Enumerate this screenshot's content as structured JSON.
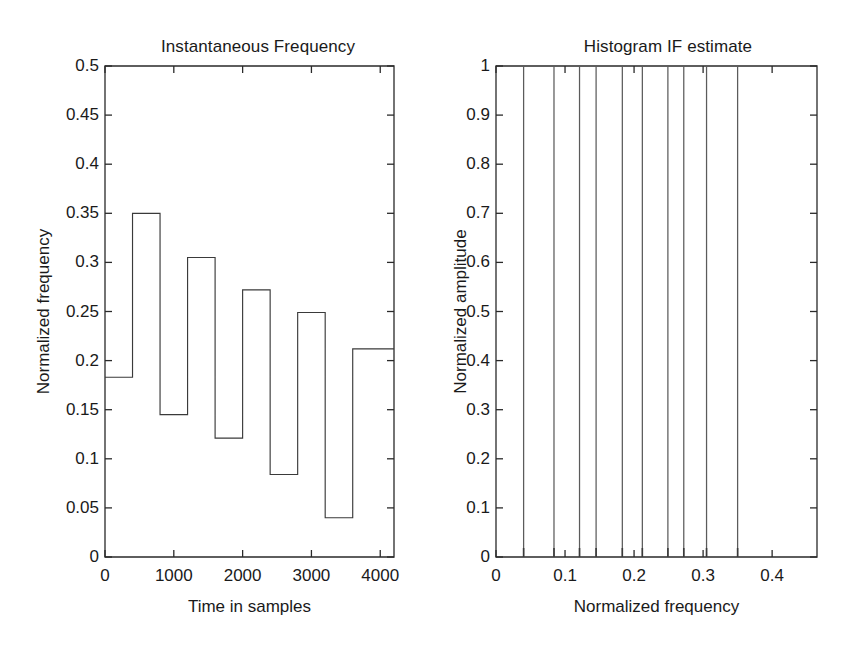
{
  "figure": {
    "background": "#ffffff",
    "line_color": "#3a3a3a",
    "axis_color": "#2a2a2a",
    "spike_color": "#5b5b5b"
  },
  "chart_data": [
    {
      "type": "line",
      "id": "instantaneous-frequency",
      "title": "Instantaneous Frequency",
      "xlabel": "Time in samples",
      "ylabel": "Normalized frequency",
      "xlim": [
        0,
        4200
      ],
      "ylim": [
        0,
        0.5
      ],
      "grid": false,
      "legend": "none",
      "drawstyle": "steps-post",
      "xticks": [
        0,
        1000,
        2000,
        3000,
        4000
      ],
      "xticklabels": [
        "0",
        "1000",
        "2000",
        "3000",
        "4000"
      ],
      "yticks": [
        0,
        0.05,
        0.1,
        0.15,
        0.2,
        0.25,
        0.3,
        0.35,
        0.4,
        0.45,
        0.5
      ],
      "yticklabels": [
        "0",
        "0.05",
        "0.1",
        "0.15",
        "0.2",
        "0.25",
        "0.3",
        "0.35",
        "0.4",
        "0.45",
        "0.5"
      ],
      "x": [
        0,
        400,
        800,
        1200,
        1600,
        2000,
        2400,
        2800,
        3200,
        3600,
        4200
      ],
      "values": [
        0.183,
        0.35,
        0.145,
        0.305,
        0.121,
        0.272,
        0.084,
        0.249,
        0.04,
        0.212
      ],
      "segments": [
        {
          "x0": 0,
          "x1": 400,
          "y": 0.183
        },
        {
          "x0": 400,
          "x1": 800,
          "y": 0.35
        },
        {
          "x0": 800,
          "x1": 1200,
          "y": 0.145
        },
        {
          "x0": 1200,
          "x1": 1600,
          "y": 0.305
        },
        {
          "x0": 1600,
          "x1": 2000,
          "y": 0.121
        },
        {
          "x0": 2000,
          "x1": 2400,
          "y": 0.272
        },
        {
          "x0": 2400,
          "x1": 2800,
          "y": 0.084
        },
        {
          "x0": 2800,
          "x1": 3200,
          "y": 0.249
        },
        {
          "x0": 3200,
          "x1": 3600,
          "y": 0.04
        },
        {
          "x0": 3600,
          "x1": 4200,
          "y": 0.212
        }
      ]
    },
    {
      "type": "bar",
      "id": "histogram-if-estimate",
      "title": "Histogram IF estimate",
      "xlabel": "Normalized frequency",
      "ylabel": "Normalized amplitude",
      "xlim": [
        0,
        0.465
      ],
      "ylim": [
        0,
        1
      ],
      "grid": false,
      "legend": "none",
      "xticks": [
        0,
        0.1,
        0.2,
        0.3,
        0.4
      ],
      "xticklabels": [
        "0",
        "0.1",
        "0.2",
        "0.3",
        "0.4"
      ],
      "yticks": [
        0,
        0.1,
        0.2,
        0.3,
        0.4,
        0.5,
        0.6,
        0.7,
        0.8,
        0.9,
        1
      ],
      "yticklabels": [
        "0",
        "0.1",
        "0.2",
        "0.3",
        "0.4",
        "0.5",
        "0.6",
        "0.7",
        "0.8",
        "0.9",
        "1"
      ],
      "categories": [
        0.04,
        0.084,
        0.121,
        0.145,
        0.183,
        0.212,
        0.249,
        0.272,
        0.305,
        0.35
      ],
      "values": [
        1,
        1,
        1,
        1,
        1,
        1,
        1,
        1,
        1,
        1
      ]
    }
  ],
  "panels": {
    "left": {
      "title": "Instantaneous Frequency",
      "xlabel": "Time in samples",
      "ylabel": "Normalized frequency"
    },
    "right": {
      "title": "Histogram IF estimate",
      "xlabel": "Normalized frequency",
      "ylabel": "Normalized amplitude"
    }
  }
}
